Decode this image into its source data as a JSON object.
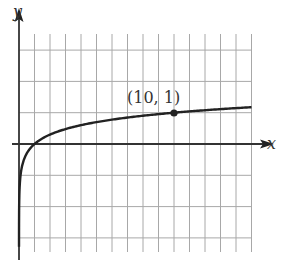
{
  "chart_data": {
    "type": "line",
    "title": "",
    "xlabel": "x",
    "ylabel": "y",
    "function": "y = log10(x)",
    "xlim": [
      0,
      15
    ],
    "ylim": [
      -3.5,
      3
    ],
    "grid": true,
    "grid_x_step": 1,
    "grid_y_step": 1,
    "x_tick_labels": [],
    "y_tick_labels": [],
    "annotations": [
      {
        "label": "(10, 1)",
        "x": 10,
        "y": 1,
        "marker": "filled-circle"
      }
    ],
    "series": [
      {
        "name": "log curve",
        "x": [
          0.0005,
          0.001,
          0.01,
          0.05,
          0.1,
          0.3,
          0.5,
          1,
          2,
          3,
          5,
          7,
          10,
          12,
          15
        ],
        "y": [
          -3.3,
          -3,
          -2,
          -1.3,
          -1,
          -0.52,
          -0.3,
          0,
          0.3,
          0.48,
          0.7,
          0.85,
          1,
          1.08,
          1.18
        ]
      }
    ]
  },
  "labels": {
    "x_axis": "x",
    "y_axis": "y",
    "point": "(10, 1)"
  },
  "colors": {
    "grid": "#a8a8a8",
    "axis": "#222222",
    "curve": "#222222"
  }
}
